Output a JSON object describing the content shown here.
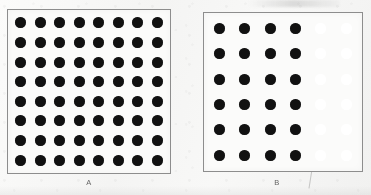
{
  "figure": {
    "background_color": "#f7f7f6",
    "panels": [
      {
        "id": "A",
        "label": "A",
        "box": {
          "x": 7,
          "y": 9,
          "width": 164,
          "height": 165
        },
        "border_color": "#8d8d8d",
        "fill_color": "#fbfbfa",
        "grid": {
          "columns": 8,
          "rows": 8
        },
        "dot": {
          "diameter": 11,
          "filled_color": "#111111"
        },
        "dot_states": [
          [
            "filled",
            "filled",
            "filled",
            "filled",
            "filled",
            "filled",
            "filled",
            "filled"
          ],
          [
            "filled",
            "filled",
            "filled",
            "filled",
            "filled",
            "filled",
            "filled",
            "filled"
          ],
          [
            "filled",
            "filled",
            "filled",
            "filled",
            "filled",
            "filled",
            "filled",
            "filled"
          ],
          [
            "filled",
            "filled",
            "filled",
            "filled",
            "filled",
            "filled",
            "filled",
            "filled"
          ],
          [
            "filled",
            "filled",
            "filled",
            "filled",
            "filled",
            "filled",
            "filled",
            "filled"
          ],
          [
            "filled",
            "filled",
            "filled",
            "filled",
            "filled",
            "filled",
            "filled",
            "filled"
          ],
          [
            "filled",
            "filled",
            "filled",
            "filled",
            "filled",
            "filled",
            "filled",
            "filled"
          ],
          [
            "filled",
            "filled",
            "filled",
            "filled",
            "filled",
            "filled",
            "filled",
            "filled"
          ]
        ],
        "filled_count": 64,
        "faint_count": 0,
        "label_position": {
          "x": 89,
          "y": 178
        }
      },
      {
        "id": "B",
        "label": "B",
        "box": {
          "x": 203,
          "y": 12,
          "width": 160,
          "height": 160
        },
        "border_color": "#8d8d8d",
        "fill_color": "#fbfbfa",
        "grid": {
          "columns": 6,
          "rows": 6
        },
        "dot": {
          "diameter": 11,
          "filled_color": "#111111",
          "faint_color": "#ffffff"
        },
        "dot_states": [
          [
            "filled",
            "filled",
            "filled",
            "filled",
            "faint",
            "faint"
          ],
          [
            "filled",
            "filled",
            "filled",
            "filled",
            "faint",
            "faint"
          ],
          [
            "filled",
            "filled",
            "filled",
            "filled",
            "faint",
            "faint"
          ],
          [
            "filled",
            "filled",
            "filled",
            "filled",
            "faint",
            "faint"
          ],
          [
            "filled",
            "filled",
            "filled",
            "filled",
            "faint",
            "faint"
          ],
          [
            "filled",
            "filled",
            "filled",
            "filled",
            "faint",
            "faint"
          ]
        ],
        "filled_count": 24,
        "faint_count": 12,
        "label_position": {
          "x": 277,
          "y": 178
        }
      }
    ]
  },
  "chart_data": {
    "type": "scatter",
    "title": "",
    "xlabel": "",
    "ylabel": "",
    "series": [
      {
        "name": "A",
        "columns": 8,
        "rows": 8,
        "filled_dots": 64,
        "faint_dots": 0,
        "total_dots": 64
      },
      {
        "name": "B",
        "columns": 6,
        "rows": 6,
        "filled_dots": 24,
        "faint_dots": 12,
        "total_dots": 36
      }
    ],
    "categories": [
      "A",
      "B"
    ],
    "values": [
      64,
      24
    ],
    "legend": [],
    "grid": false
  }
}
